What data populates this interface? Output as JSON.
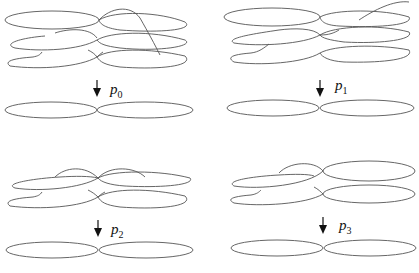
{
  "diagram": {
    "type": "covering-spaces-of-figure-eight",
    "panels": [
      {
        "id": "p0",
        "label": "p",
        "subscript": "0",
        "cover_sheets": 3,
        "base": "figure-eight (wedge of two circles)"
      },
      {
        "id": "p1",
        "label": "p",
        "subscript": "1",
        "cover_sheets": 3,
        "base": "figure-eight (wedge of two circles)"
      },
      {
        "id": "p2",
        "label": "p",
        "subscript": "2",
        "cover_sheets": 2,
        "base": "figure-eight (wedge of two circles)"
      },
      {
        "id": "p3",
        "label": "p",
        "subscript": "3",
        "cover_sheets": 2,
        "base": "figure-eight (wedge of two circles)"
      }
    ],
    "colors": {
      "curve": "#555555",
      "arrow": "#111111",
      "background": "#ffffff"
    }
  }
}
